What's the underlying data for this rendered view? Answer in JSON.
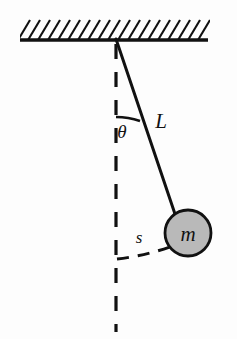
{
  "figure": {
    "type": "physics-diagram",
    "background_color": "#fdfdfd",
    "ink_color": "#111111"
  },
  "labels": {
    "length": "L",
    "mass": "m",
    "arc_length": "s",
    "angle": "θ"
  },
  "geometry": {
    "pivot": {
      "x": 116,
      "y": 39
    },
    "bob": {
      "cx": 188,
      "cy": 233,
      "r": 23,
      "fill": "#b9b9b9",
      "stroke": "#111111"
    },
    "string": {
      "x1": 116,
      "y1": 39,
      "x2": 175,
      "y2": 216
    },
    "vertical_dashed": {
      "x1": 116,
      "y1": 42,
      "x2": 116,
      "y2": 332
    },
    "ceiling": {
      "x1": 20,
      "y1": 40,
      "x2": 208,
      "y2": 40
    },
    "hatch_count": 19,
    "angle_arc": {
      "cx": 116,
      "cy": 39,
      "r": 78
    },
    "swing_arc": {
      "from_x": 117,
      "from_y": 259,
      "to_x": 170,
      "to_y": 247
    }
  },
  "colors": {
    "line": "#111111",
    "bob_fill": "#b9b9b9",
    "background": "#fdfdfd"
  }
}
